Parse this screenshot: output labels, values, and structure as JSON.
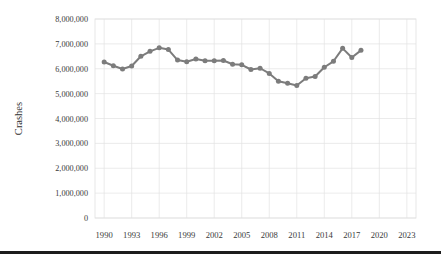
{
  "chart_data": {
    "type": "line",
    "title": "",
    "xlabel": "",
    "ylabel": "Crashes",
    "x": [
      1990,
      1991,
      1992,
      1993,
      1994,
      1995,
      1996,
      1997,
      1998,
      1999,
      2000,
      2001,
      2002,
      2003,
      2004,
      2005,
      2006,
      2007,
      2008,
      2009,
      2010,
      2011,
      2012,
      2013,
      2014,
      2015,
      2016,
      2017,
      2018
    ],
    "values": [
      6270000,
      6120000,
      5990000,
      6110000,
      6500000,
      6700000,
      6840000,
      6770000,
      6350000,
      6280000,
      6390000,
      6320000,
      6320000,
      6330000,
      6180000,
      6160000,
      5970000,
      6020000,
      5810000,
      5500000,
      5420000,
      5330000,
      5620000,
      5690000,
      6060000,
      6300000,
      6820000,
      6450000,
      6740000
    ],
    "series": [
      {
        "name": "Crashes",
        "color": "#7c7c7c",
        "values": [
          6270000,
          6120000,
          5990000,
          6110000,
          6500000,
          6700000,
          6840000,
          6770000,
          6350000,
          6280000,
          6390000,
          6320000,
          6320000,
          6330000,
          6180000,
          6160000,
          5970000,
          6020000,
          5810000,
          5500000,
          5420000,
          5330000,
          5620000,
          5690000,
          6060000,
          6300000,
          6820000,
          6450000,
          6740000
        ]
      }
    ],
    "ylim": [
      0,
      8000000
    ],
    "xlim": [
      1989,
      2024
    ],
    "ytick_values": [
      0,
      1000000,
      2000000,
      3000000,
      4000000,
      5000000,
      6000000,
      7000000,
      8000000
    ],
    "ytick_labels": [
      "0",
      "1,000,000",
      "2,000,000",
      "3,000,000",
      "4,000,000",
      "5,000,000",
      "6,000,000",
      "7,000,000",
      "8,000,000"
    ],
    "xtick_values": [
      1990,
      1993,
      1996,
      1999,
      2002,
      2005,
      2008,
      2011,
      2014,
      2017,
      2020,
      2023
    ],
    "xtick_labels": [
      "1990",
      "1993",
      "1996",
      "1999",
      "2002",
      "2005",
      "2008",
      "2011",
      "2014",
      "2017",
      "2020",
      "2023"
    ],
    "grid": "horizontal-and-vertical",
    "legend": "none",
    "marker": "circle",
    "colors": {
      "line": "#7c7c7c",
      "marker": "#7c7c7c",
      "grid": "#e3e3e3",
      "text": "#3a3a3a",
      "rule": "#1c1c1c"
    }
  }
}
